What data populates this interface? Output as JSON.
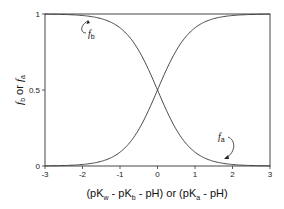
{
  "chart_data": {
    "type": "line",
    "title": "",
    "xlabel": "(pK_w - pK_b - pH) or (pK_a - pH)",
    "ylabel": "f_b or f_a",
    "xlim": [
      -3,
      3
    ],
    "ylim": [
      0,
      1
    ],
    "x_ticks": [
      "-3",
      "-2",
      "-1",
      "0",
      "1",
      "2",
      "3"
    ],
    "y_ticks": [
      "0",
      "0.5",
      "1"
    ],
    "grid": false,
    "legend": null,
    "series": [
      {
        "name": "f_b",
        "formula": "1/(1+10^x)",
        "x": [
          -3,
          -2.5,
          -2,
          -1.5,
          -1,
          -0.5,
          0,
          0.5,
          1,
          1.5,
          2,
          2.5,
          3
        ],
        "values": [
          0.999,
          0.997,
          0.99,
          0.969,
          0.909,
          0.76,
          0.5,
          0.24,
          0.091,
          0.031,
          0.01,
          0.003,
          0.001
        ]
      },
      {
        "name": "f_a",
        "formula": "1/(1+10^-x)",
        "x": [
          -3,
          -2.5,
          -2,
          -1.5,
          -1,
          -0.5,
          0,
          0.5,
          1,
          1.5,
          2,
          2.5,
          3
        ],
        "values": [
          0.001,
          0.003,
          0.01,
          0.031,
          0.091,
          0.24,
          0.5,
          0.76,
          0.909,
          0.969,
          0.99,
          0.997,
          0.999
        ]
      }
    ],
    "annotations": [
      {
        "text": "f_b",
        "points_to_x": -2.4,
        "position": "upper-left"
      },
      {
        "text": "f_a",
        "points_to_x": 1.8,
        "position": "lower-right"
      }
    ]
  },
  "labels": {
    "xlabel_parts": [
      "(pK",
      "w",
      " - pK",
      "b",
      " - pH)  or  (pK",
      "a",
      " - pH)"
    ],
    "ylabel_f": "f",
    "ylabel_b": "b",
    "ylabel_or": " or ",
    "ylabel_a": "a",
    "annot_fb": "f",
    "annot_fb_sub": "b",
    "annot_fa": "f",
    "annot_fa_sub": "a"
  }
}
